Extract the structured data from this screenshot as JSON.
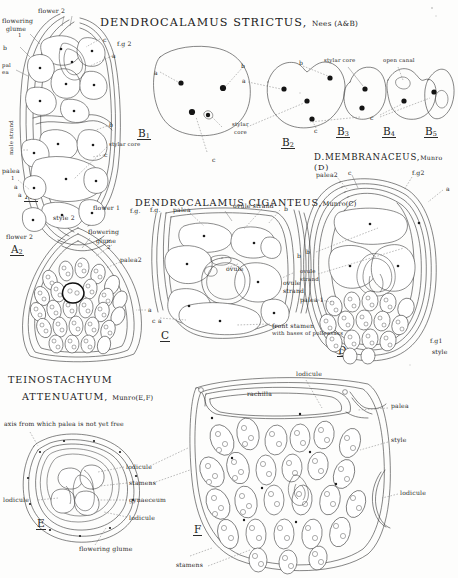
{
  "plate": {
    "paper_color": "#fdfdfc",
    "ink_color": "#2a2a2a",
    "corner_mark": "."
  },
  "titles": {
    "ab": {
      "genus": "DENDROCALAMUS",
      "species": "STRICTUS,",
      "authority": "Nees (A&B)"
    },
    "c": {
      "genus": "DENDROCALAMUS",
      "species": "CIGANTEUS,",
      "authority": "Munro(C)"
    },
    "d": {
      "name": "D.MEMBRANACEUS,",
      "authority": "Munro",
      "fig": "(D)"
    },
    "ef": {
      "genus": "TEINOSTACHYUM",
      "species": "ATTENUATUM,",
      "authority": "Munro(E,F)"
    }
  },
  "figure_labels": {
    "a1": "A",
    "a1_sub": "1",
    "a2": "A",
    "a2_sub": "2",
    "b1": "B",
    "b1_sub": "1",
    "b2": "B",
    "b2_sub": "2",
    "b3": "B",
    "b3_sub": "3",
    "b4": "B",
    "b4_sub": "4",
    "b5": "B",
    "b5_sub": "5",
    "c": "C",
    "d": "D",
    "e": "E",
    "f": "F"
  },
  "annotations": {
    "a1": [
      {
        "text": "flower 2",
        "x": 38,
        "y": 8,
        "size": "sm"
      },
      {
        "text": "flowering",
        "x": 2,
        "y": 18,
        "size": "sm"
      },
      {
        "text": "glume",
        "x": 6,
        "y": 26,
        "size": "sm"
      },
      {
        "text": "1",
        "x": 18,
        "y": 33,
        "size": "xs"
      },
      {
        "text": "b",
        "x": 3,
        "y": 45,
        "size": "sm"
      },
      {
        "text": "pal",
        "x": 2,
        "y": 63,
        "size": "xs"
      },
      {
        "text": "ea",
        "x": 2,
        "y": 70,
        "size": "xs"
      },
      {
        "text": "male strand",
        "x": 9,
        "y": 155,
        "size": "xs",
        "rotated": true
      },
      {
        "text": "palea",
        "x": 2,
        "y": 168,
        "size": "sm"
      },
      {
        "text": "1",
        "x": 11,
        "y": 176,
        "size": "xs"
      },
      {
        "text": "a",
        "x": 14,
        "y": 184,
        "size": "sm"
      },
      {
        "text": "c",
        "x": 103,
        "y": 37,
        "size": "sm"
      },
      {
        "text": "f.g 2",
        "x": 117,
        "y": 41,
        "size": "sm"
      },
      {
        "text": "a",
        "x": 112,
        "y": 53,
        "size": "sm"
      },
      {
        "text": "b",
        "x": 109,
        "y": 122,
        "size": "sm"
      },
      {
        "text": "stylar core",
        "x": 109,
        "y": 142,
        "size": "xs"
      },
      {
        "text": "c",
        "x": 104,
        "y": 152,
        "size": "sm"
      },
      {
        "text": "a",
        "x": 18,
        "y": 192,
        "size": "sm"
      },
      {
        "text": "style 2",
        "x": 53,
        "y": 215,
        "size": "sm"
      },
      {
        "text": "flower 1",
        "x": 93,
        "y": 205,
        "size": "sm"
      },
      {
        "text": "f.g.",
        "x": 130,
        "y": 208,
        "size": "sm"
      }
    ],
    "a2": [
      {
        "text": "flower 2",
        "x": 6,
        "y": 234,
        "size": "sm"
      },
      {
        "text": "flowering",
        "x": 88,
        "y": 229,
        "size": "sm"
      },
      {
        "text": "glume",
        "x": 96,
        "y": 238,
        "size": "sm"
      },
      {
        "text": "2",
        "x": 107,
        "y": 245,
        "size": "xs"
      },
      {
        "text": "palea2",
        "x": 120,
        "y": 257,
        "size": "sm"
      },
      {
        "text": "a",
        "x": 148,
        "y": 307,
        "size": "sm"
      }
    ],
    "b": [
      {
        "text": "a",
        "x": 154,
        "y": 70,
        "size": "sm"
      },
      {
        "text": "b",
        "x": 241,
        "y": 63,
        "size": "sm"
      },
      {
        "text": "a",
        "x": 242,
        "y": 78,
        "size": "sm"
      },
      {
        "text": "stylar",
        "x": 232,
        "y": 122,
        "size": "xs"
      },
      {
        "text": "core",
        "x": 234,
        "y": 130,
        "size": "xs"
      },
      {
        "text": "c",
        "x": 212,
        "y": 157,
        "size": "sm"
      },
      {
        "text": "b",
        "x": 299,
        "y": 60,
        "size": "sm"
      },
      {
        "text": "c",
        "x": 314,
        "y": 128,
        "size": "sm"
      },
      {
        "text": "stylar core",
        "x": 324,
        "y": 58,
        "size": "xs"
      },
      {
        "text": "open canal",
        "x": 383,
        "y": 58,
        "size": "xs"
      },
      {
        "text": "c",
        "x": 370,
        "y": 115,
        "size": "sm"
      }
    ],
    "c": [
      {
        "text": "palea",
        "x": 173,
        "y": 207,
        "size": "sm"
      },
      {
        "text": "ovule strand",
        "x": 233,
        "y": 203,
        "size": "sm"
      },
      {
        "text": "b",
        "x": 284,
        "y": 206,
        "size": "sm"
      },
      {
        "text": "ovule",
        "x": 226,
        "y": 266,
        "size": "sm"
      },
      {
        "text": "ovule",
        "x": 283,
        "y": 280,
        "size": "sm"
      },
      {
        "text": "strand",
        "x": 283,
        "y": 288,
        "size": "sm"
      },
      {
        "text": "b",
        "x": 297,
        "y": 253,
        "size": "sm"
      },
      {
        "text": "a",
        "x": 158,
        "y": 318,
        "size": "sm"
      },
      {
        "text": "c",
        "x": 152,
        "y": 318,
        "size": "sm"
      },
      {
        "text": "front stamen",
        "x": 272,
        "y": 323,
        "size": "sm"
      },
      {
        "text": "with bases of pollensacs",
        "x": 272,
        "y": 331,
        "size": "xs"
      },
      {
        "text": "f.g.",
        "x": 150,
        "y": 207,
        "size": "sm"
      }
    ],
    "d": [
      {
        "text": "palea2",
        "x": 316,
        "y": 172,
        "size": "sm"
      },
      {
        "text": "c",
        "x": 348,
        "y": 170,
        "size": "sm"
      },
      {
        "text": "f.g2",
        "x": 412,
        "y": 170,
        "size": "sm"
      },
      {
        "text": "a",
        "x": 446,
        "y": 186,
        "size": "sm"
      },
      {
        "text": "b",
        "x": 306,
        "y": 249,
        "size": "sm"
      },
      {
        "text": "ovule",
        "x": 300,
        "y": 269,
        "size": "xs"
      },
      {
        "text": "strand",
        "x": 300,
        "y": 277,
        "size": "xs"
      },
      {
        "text": "palea 1",
        "x": 300,
        "y": 297,
        "size": "sm"
      },
      {
        "text": "f.g1",
        "x": 430,
        "y": 338,
        "size": "sm"
      },
      {
        "text": "style",
        "x": 432,
        "y": 349,
        "size": "sm"
      }
    ],
    "e": [
      {
        "text": "axis from which palea is not yet free",
        "x": 4,
        "y": 421,
        "size": "sm"
      },
      {
        "text": "lodicule",
        "x": 126,
        "y": 464,
        "size": "sm"
      },
      {
        "text": "stamens",
        "x": 129,
        "y": 480,
        "size": "sm"
      },
      {
        "text": "gynaeceum",
        "x": 129,
        "y": 497,
        "size": "sm"
      },
      {
        "text": "lodicule",
        "x": 129,
        "y": 515,
        "size": "sm"
      },
      {
        "text": "lodicule",
        "x": 3,
        "y": 497,
        "size": "sm"
      },
      {
        "text": "flowering glume",
        "x": 79,
        "y": 546,
        "size": "sm"
      }
    ],
    "f": [
      {
        "text": "lodicule",
        "x": 296,
        "y": 371,
        "size": "sm"
      },
      {
        "text": "rachilla",
        "x": 247,
        "y": 391,
        "size": "sm"
      },
      {
        "text": "palea",
        "x": 391,
        "y": 403,
        "size": "sm"
      },
      {
        "text": "style",
        "x": 391,
        "y": 437,
        "size": "sm"
      },
      {
        "text": "lodicule",
        "x": 400,
        "y": 490,
        "size": "sm"
      },
      {
        "text": "stamens",
        "x": 176,
        "y": 562,
        "size": "sm"
      }
    ]
  }
}
